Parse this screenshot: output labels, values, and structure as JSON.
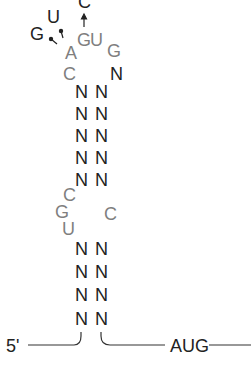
{
  "diagram": {
    "type": "RNA secondary structure (stem-loop)",
    "colors": {
      "paired": "#222222",
      "unpaired": "#7f7f7f",
      "line": "#333333"
    },
    "mutations": [
      {
        "label": "G",
        "from": "A"
      },
      {
        "label": "U",
        "from": "A"
      },
      {
        "label": "C",
        "from": "G"
      }
    ],
    "loop": {
      "left": [
        "C",
        "A"
      ],
      "top": [
        "G",
        "U",
        "G"
      ],
      "right": [
        "N"
      ]
    },
    "upper_stem": [
      [
        "N",
        "N"
      ],
      [
        "N",
        "N"
      ],
      [
        "N",
        "N"
      ],
      [
        "N",
        "N"
      ],
      [
        "N",
        "N"
      ]
    ],
    "bulge": {
      "left": [
        "C",
        "G",
        "U"
      ],
      "right": [
        "C"
      ]
    },
    "lower_stem": [
      [
        "N",
        "N"
      ],
      [
        "N",
        "N"
      ],
      [
        "N",
        "N"
      ],
      [
        "N",
        "N"
      ]
    ],
    "five_prime_label": "5'",
    "start_codon": "AUG"
  }
}
